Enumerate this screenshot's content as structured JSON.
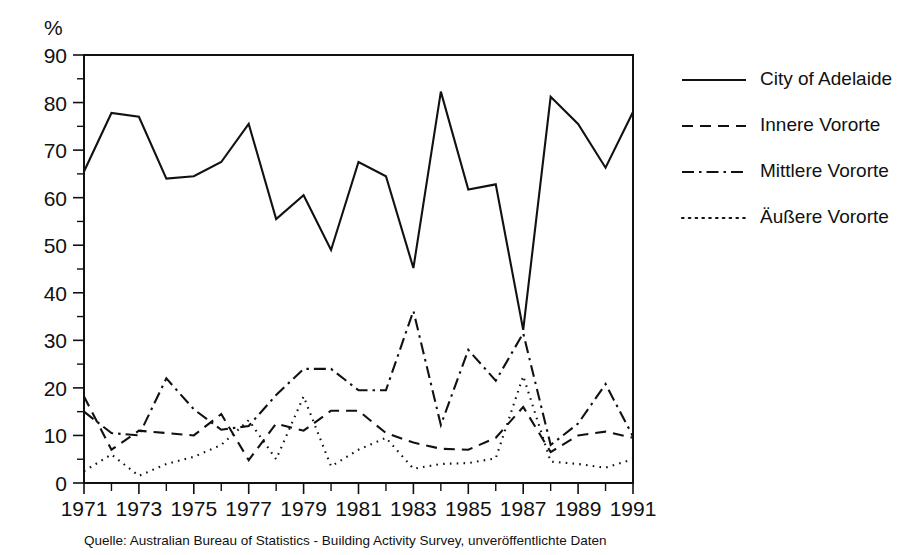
{
  "chart_data": {
    "type": "line",
    "title": "",
    "subtitle": "",
    "xlabel": "",
    "ylabel": "%",
    "unit_label": "%",
    "xlim": [
      1971,
      1991
    ],
    "ylim": [
      0,
      90
    ],
    "ytick_step": 10,
    "yminor_step": 5,
    "xtick_step": 1,
    "xlabel_step": 2,
    "grid": false,
    "legend_position": "right",
    "x": [
      1971,
      1972,
      1973,
      1974,
      1975,
      1976,
      1977,
      1978,
      1979,
      1980,
      1981,
      1982,
      1983,
      1984,
      1985,
      1986,
      1987,
      1988,
      1989,
      1990,
      1991
    ],
    "ytick_labels": [
      "0",
      "10",
      "20",
      "30",
      "40",
      "50",
      "60",
      "70",
      "80",
      "90"
    ],
    "xtick_labels": [
      "1971",
      "",
      "1973",
      "",
      "1975",
      "",
      "1977",
      "",
      "1979",
      "",
      "1981",
      "",
      "1983",
      "",
      "1985",
      "",
      "1987",
      "",
      "1989",
      "",
      "1991"
    ],
    "series": [
      {
        "name": "City of Adelaide",
        "dash_style": "solid",
        "dasharray": "",
        "values": [
          65.5,
          77.8,
          77.0,
          64.0,
          64.5,
          67.5,
          75.5,
          55.5,
          60.5,
          49.0,
          67.5,
          64.5,
          45.2,
          82.3,
          61.7,
          62.8,
          32.2,
          81.2,
          75.5,
          66.3,
          78.0
        ]
      },
      {
        "name": "Innere Vororte",
        "dash_style": "dashed",
        "dasharray": "11,7",
        "values": [
          18.2,
          7.0,
          11.0,
          10.5,
          10.0,
          14.5,
          4.8,
          12.5,
          11.0,
          15.2,
          15.2,
          10.5,
          8.5,
          7.2,
          7.0,
          9.5,
          16.0,
          6.5,
          10.0,
          10.8,
          9.5
        ]
      },
      {
        "name": "Mittlere Vororte",
        "dash_style": "dashdot",
        "dasharray": "12,5,2.5,5",
        "values": [
          15.0,
          10.5,
          10.0,
          22.0,
          15.5,
          11.2,
          12.0,
          18.5,
          24.0,
          24.0,
          19.5,
          19.5,
          36.2,
          12.2,
          28.0,
          21.5,
          31.5,
          8.0,
          12.5,
          20.8,
          9.8
        ]
      },
      {
        "name": "Äußere Vororte",
        "dash_style": "dotted",
        "dasharray": "1.6,5.2",
        "values": [
          2.5,
          6.0,
          1.5,
          4.0,
          5.5,
          8.0,
          13.2,
          5.0,
          18.2,
          3.5,
          7.0,
          9.5,
          3.0,
          4.0,
          4.2,
          5.2,
          22.5,
          4.5,
          4.0,
          3.2,
          5.0
        ]
      }
    ],
    "source_note": "Quelle: Australian Bureau of Statistics - Building Activity Survey, unveröffentlichte Daten"
  },
  "legend": {
    "entries": [
      {
        "label": "City of Adelaide"
      },
      {
        "label": "Innere Vororte"
      },
      {
        "label": "Mittlere Vororte"
      },
      {
        "label": "Äußere Vororte"
      }
    ]
  },
  "colors": {
    "ink": "#111111",
    "background": "#ffffff"
  }
}
